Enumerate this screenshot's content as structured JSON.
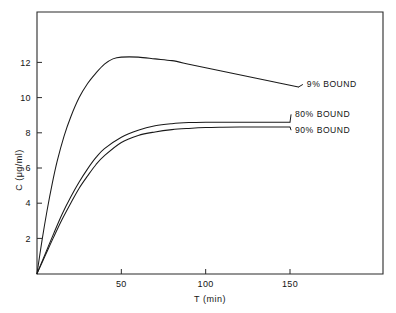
{
  "chart_data": {
    "type": "line",
    "title": "",
    "subtitle": "",
    "xlabel": "T (min)",
    "ylabel": "C (μg/ml)",
    "xlim": [
      0,
      180
    ],
    "ylim": [
      0,
      13.5
    ],
    "xticks": [
      50,
      100,
      150
    ],
    "xticklabels": [
      "50",
      "100",
      "150"
    ],
    "yticks": [
      2,
      4,
      6,
      8,
      10,
      12
    ],
    "yticklabels": [
      "2",
      "4",
      "6",
      "8",
      "10",
      "12"
    ],
    "grid": false,
    "legend_position": "inline-right-annotations",
    "series": [
      {
        "name": "9% BOUND",
        "label": "9% BOUND",
        "x": [
          0,
          3,
          6,
          9,
          12,
          16,
          20,
          25,
          30,
          35,
          40,
          45,
          50,
          60,
          70,
          80,
          90,
          100,
          110,
          120,
          130,
          140,
          150,
          155
        ],
        "y": [
          0.0,
          1.9,
          3.6,
          5.1,
          6.4,
          7.8,
          8.9,
          10.0,
          10.8,
          11.4,
          11.9,
          12.2,
          12.3,
          12.3,
          12.2,
          12.1,
          11.9,
          11.7,
          11.5,
          11.3,
          11.1,
          10.9,
          10.7,
          10.6
        ]
      },
      {
        "name": "80% BOUND",
        "label": "80% BOUND",
        "x": [
          0,
          5,
          10,
          15,
          20,
          25,
          30,
          35,
          40,
          50,
          60,
          70,
          80,
          90,
          100,
          110,
          120,
          130,
          140,
          150
        ],
        "y": [
          0.0,
          1.15,
          2.3,
          3.4,
          4.35,
          5.2,
          5.95,
          6.6,
          7.1,
          7.75,
          8.15,
          8.4,
          8.52,
          8.58,
          8.6,
          8.6,
          8.6,
          8.6,
          8.6,
          8.6
        ]
      },
      {
        "name": "90% BOUND",
        "label": "90% BOUND",
        "x": [
          0,
          5,
          10,
          15,
          20,
          25,
          30,
          35,
          40,
          50,
          60,
          70,
          80,
          90,
          100,
          110,
          120,
          130,
          140,
          150
        ],
        "y": [
          0.0,
          1.05,
          2.1,
          3.1,
          4.0,
          4.85,
          5.55,
          6.2,
          6.7,
          7.45,
          7.85,
          8.05,
          8.18,
          8.25,
          8.3,
          8.32,
          8.33,
          8.33,
          8.33,
          8.33
        ]
      }
    ],
    "annotations": [
      {
        "text": "9% BOUND",
        "series": "9% BOUND",
        "x": 160,
        "y": 10.6
      },
      {
        "text": "80% BOUND",
        "series": "80% BOUND",
        "x": 153,
        "y": 8.9
      },
      {
        "text": "90% BOUND",
        "series": "90% BOUND",
        "x": 153,
        "y": 8.0
      }
    ],
    "colors": {
      "line": "#1a1a1a",
      "axis": "#2b2b2b",
      "background": "#ffffff",
      "text": "#141414"
    }
  }
}
